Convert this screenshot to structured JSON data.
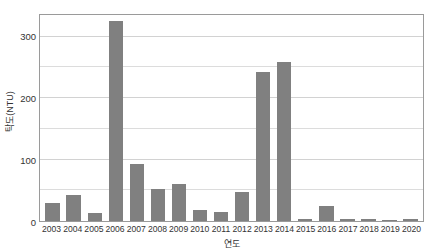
{
  "chart_data": {
    "type": "bar",
    "title": "",
    "xlabel": "연도",
    "ylabel": "탁도(NTU)",
    "categories": [
      "2003",
      "2004",
      "2005",
      "2006",
      "2007",
      "2008",
      "2009",
      "2010",
      "2011",
      "2012",
      "2013",
      "2014",
      "2015",
      "2016",
      "2017",
      "2018",
      "2019",
      "2020"
    ],
    "values": [
      29,
      42,
      13,
      326,
      93,
      52,
      60,
      18,
      15,
      47,
      243,
      259,
      4,
      24,
      4,
      3,
      2,
      4
    ],
    "series": [
      {
        "name": "탁도(NTU)",
        "values": [
          29,
          42,
          13,
          326,
          93,
          52,
          60,
          18,
          15,
          47,
          243,
          259,
          4,
          24,
          4,
          3,
          2,
          4
        ]
      }
    ],
    "ylim": [
      0,
      335
    ],
    "y_ticks": [
      0,
      100,
      200,
      300
    ],
    "y_tick_labels": [
      "0",
      "100",
      "200",
      "300"
    ],
    "y_minor_gridlines": [
      50,
      150,
      250,
      300
    ],
    "grid": true,
    "grid_interval": 50,
    "legend": "none",
    "legend_position": "none",
    "bar_color": "#808080",
    "gridline_color": "#dcdcdc",
    "frame_color": "#9a9a9a",
    "axis_text_color": "#333333",
    "background_color": "#ffffff"
  }
}
